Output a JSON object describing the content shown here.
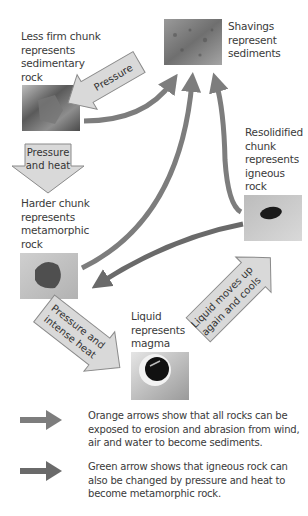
{
  "diagram": {
    "colors": {
      "orange_arrow": "#7f7f7f",
      "green_arrow": "#6b6b6b",
      "block_arrow_fill": "#d9d9d9",
      "block_arrow_stroke": "#8a8a8a",
      "text": "#3a3a3a"
    },
    "nodes": {
      "sediments": {
        "label": "Shavings represent sediments",
        "lines": [
          "Shavings",
          "represent",
          "sediments"
        ],
        "image": "shavings-photo"
      },
      "sedimentary": {
        "label": "Less firm chunk represents sedimentary rock",
        "lines": [
          "Less firm chunk",
          "represents",
          "sedimentary",
          "rock"
        ],
        "image": "less-firm-chunk-photo"
      },
      "metamorphic": {
        "label": "Harder chunk represents metamorphic rock",
        "lines": [
          "Harder chunk",
          "represents",
          "metamorphic",
          "rock"
        ],
        "image": "harder-chunk-photo"
      },
      "igneous": {
        "label": "Resolidified chunk represents igneous rock",
        "lines": [
          "Resolidified",
          "chunk",
          "represents",
          "igneous",
          "rock"
        ],
        "image": "resolidified-chunk-photo"
      },
      "magma": {
        "label": "Liquid represents magma",
        "lines": [
          "Liquid",
          "represents",
          "magma"
        ],
        "image": "liquid-photo"
      }
    },
    "block_arrows": {
      "pressure": {
        "text": "Pressure"
      },
      "pressure_heat": {
        "line1": "Pressure",
        "line2": "and heat"
      },
      "pressure_intense_heat": {
        "line1": "Pressure and",
        "line2": "intense heat"
      },
      "liquid_moves_up": {
        "line1": "Liquid moves up",
        "line2": "again and cools"
      }
    },
    "legend": [
      {
        "arrow": "orange-arrow",
        "text": "Orange arrows show that all rocks can be exposed to erosion and abrasion from wind, air and water to become sediments."
      },
      {
        "arrow": "green-arrow",
        "text": "Green arrow shows that igneous rock can also be changed by pressure and heat to become metamorphic rock."
      }
    ]
  }
}
